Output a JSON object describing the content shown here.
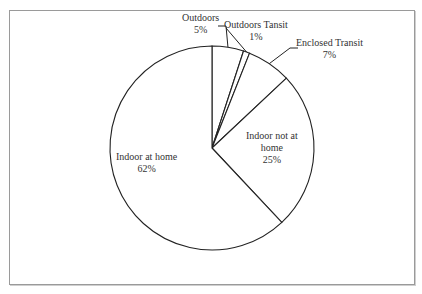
{
  "chart_data": {
    "type": "pie",
    "title": "",
    "start_angle": "12 o'clock",
    "direction": "clockwise",
    "categories": [
      "Outdoors",
      "Outdoors Tansit",
      "Enclosed Transit",
      "Indoor not at home",
      "Indoor at home"
    ],
    "values": [
      5,
      1,
      7,
      25,
      62
    ],
    "unit": "%",
    "labels": [
      {
        "name": "Outdoors",
        "pct": "5%"
      },
      {
        "name": "Outdoors Tansit",
        "pct": "1%"
      },
      {
        "name": "Enclosed Transit",
        "pct": "7%"
      },
      {
        "name": "Indoor not at",
        "name2": "home",
        "pct": "25%"
      },
      {
        "name": "Indoor at home",
        "pct": "62%"
      }
    ],
    "fill_color": "#ffffff",
    "stroke_color": "#222222",
    "legend": "none (data labels)"
  }
}
